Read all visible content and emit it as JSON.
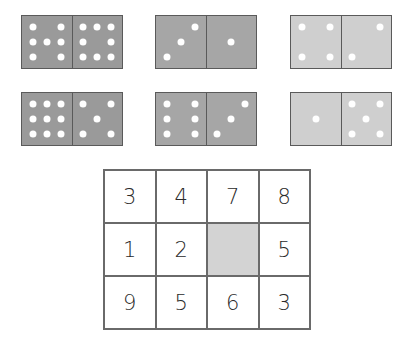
{
  "dominoes": [
    {
      "left": 7,
      "right": 8,
      "x": 21,
      "y": 15,
      "color": "#9a9a9a"
    },
    {
      "left": 3,
      "right": 1,
      "x": 155,
      "y": 15,
      "color": "#a6a6a6"
    },
    {
      "left": 4,
      "right": 2,
      "x": 290,
      "y": 15,
      "color": "#cfcfcf"
    },
    {
      "left": 9,
      "right": 5,
      "x": 21,
      "y": 92,
      "color": "#9a9a9a"
    },
    {
      "left": 6,
      "right": 3,
      "x": 155,
      "y": 92,
      "color": "#a6a6a6"
    },
    {
      "left": 1,
      "right": 5,
      "x": 290,
      "y": 92,
      "color": "#cfcfcf"
    }
  ],
  "grid": {
    "rows": [
      [
        "3",
        "4",
        "7",
        "8"
      ],
      [
        "1",
        "2",
        "",
        "5"
      ],
      [
        "9",
        "5",
        "6",
        "3"
      ]
    ],
    "missing_cell": {
      "row": 1,
      "col": 2,
      "color": "#d3d3d3"
    }
  }
}
